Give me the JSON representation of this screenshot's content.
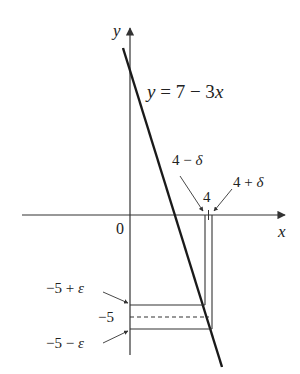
{
  "diagram": {
    "type": "epsilon-delta limit illustration",
    "axes": {
      "x_label": "x",
      "y_label": "y",
      "origin_label": "0"
    },
    "function": {
      "label": "y = 7 − 3x",
      "slope": -3,
      "intercept": 7
    },
    "x_markers": {
      "center_label": "4",
      "left_label": "4 − δ",
      "right_label": "4 + δ"
    },
    "y_markers": {
      "center_label": "−5",
      "upper_label": "−5 + ε",
      "lower_label": "−5 − ε"
    },
    "colors": {
      "line": "#1a1a1a",
      "axis": "#333333",
      "text": "#222222"
    }
  }
}
